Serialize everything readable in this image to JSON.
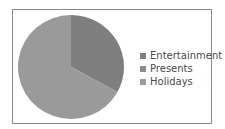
{
  "chart_data": {
    "type": "pie",
    "title": "",
    "categories": [
      "Entertainment",
      "Presents",
      "Holidays"
    ],
    "values": [
      33,
      0,
      67
    ],
    "colors": [
      "#7f7f7f",
      "#8c8c8c",
      "#9a9a9a"
    ],
    "legend_position": "right"
  },
  "legend": {
    "items": [
      {
        "label": "Entertainment",
        "color": "#7f7f7f"
      },
      {
        "label": "Presents",
        "color": "#8c8c8c"
      },
      {
        "label": "Holidays",
        "color": "#9a9a9a"
      }
    ]
  }
}
